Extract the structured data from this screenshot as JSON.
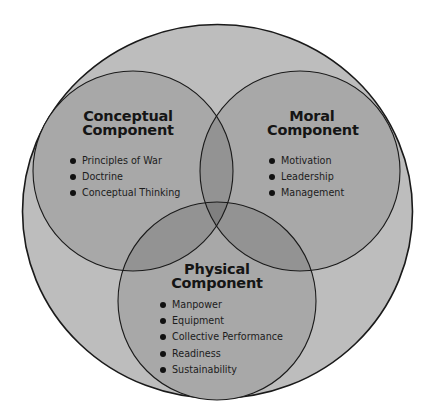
{
  "diagram": {
    "type": "venn",
    "colors": {
      "outer_fill": "#bdbdbd",
      "circle_fill": "#a8a8a8",
      "double_overlap": "#939393",
      "triple_overlap": "#808080",
      "stroke": "#1a1a1a",
      "text": "#161616"
    },
    "outer": {
      "label": ""
    },
    "components": [
      {
        "id": "conceptual",
        "title_line1": "Conceptual",
        "title_line2": "Component",
        "items": [
          "Principles of War",
          "Doctrine",
          "Conceptual Thinking"
        ]
      },
      {
        "id": "moral",
        "title_line1": "Moral",
        "title_line2": "Component",
        "items": [
          "Motivation",
          "Leadership",
          "Management"
        ]
      },
      {
        "id": "physical",
        "title_line1": "Physical",
        "title_line2": "Component",
        "items": [
          "Manpower",
          "Equipment",
          "Collective Performance",
          "Readiness",
          "Sustainability"
        ]
      }
    ]
  }
}
